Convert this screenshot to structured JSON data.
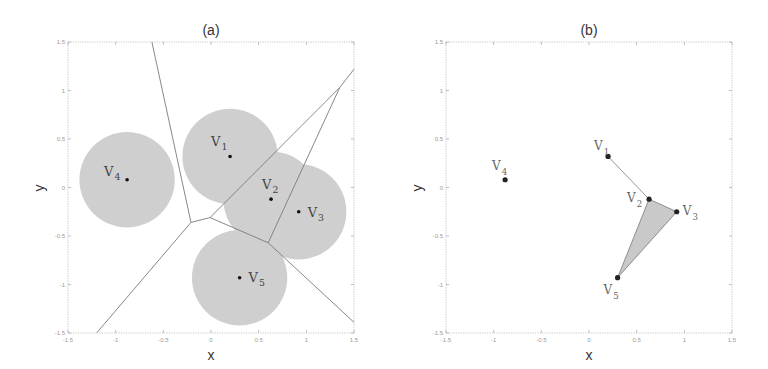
{
  "figure": {
    "panels": [
      {
        "id": "a",
        "title": "(a)",
        "xlabel": "x",
        "ylabel": "y"
      },
      {
        "id": "b",
        "title": "(b)",
        "xlabel": "x",
        "ylabel": "y"
      }
    ],
    "xticks": [
      "-1.5",
      "-1",
      "-0.5",
      "0",
      "0.5",
      "1",
      "1.5"
    ],
    "yticks": [
      "1.5",
      "1",
      "0.5",
      "0",
      "-0.5",
      "-1",
      "-1.5"
    ]
  },
  "chart_data": [
    {
      "type": "scatter",
      "title": "(a)",
      "xlabel": "x",
      "ylabel": "y",
      "xlim": [
        -1.5,
        1.5
      ],
      "ylim": [
        -1.5,
        1.5
      ],
      "grid": false,
      "description": "Nodes with sensing disks (radius ~0.5) and Voronoi partition",
      "disk_radius": 0.5,
      "points": [
        {
          "name": "V1",
          "sub": "1",
          "x": 0.2,
          "y": 0.32
        },
        {
          "name": "V2",
          "sub": "2",
          "x": 0.63,
          "y": -0.12
        },
        {
          "name": "V3",
          "sub": "3",
          "x": 0.92,
          "y": -0.25
        },
        {
          "name": "V4",
          "sub": "4",
          "x": -0.88,
          "y": 0.08
        },
        {
          "name": "V5",
          "sub": "5",
          "x": 0.3,
          "y": -0.93
        }
      ],
      "voronoi_edges": [
        [
          [
            -0.62,
            1.5
          ],
          [
            -0.21,
            -0.36
          ]
        ],
        [
          [
            -0.21,
            -0.36
          ],
          [
            -0.01,
            -0.31
          ]
        ],
        [
          [
            -0.21,
            -0.36
          ],
          [
            -1.2,
            -1.5
          ]
        ],
        [
          [
            -0.01,
            -0.31
          ],
          [
            1.35,
            1.03
          ]
        ],
        [
          [
            -0.01,
            -0.31
          ],
          [
            0.6,
            -0.57
          ]
        ],
        [
          [
            0.6,
            -0.57
          ],
          [
            1.35,
            1.03
          ]
        ],
        [
          [
            0.6,
            -0.57
          ],
          [
            1.5,
            -1.39
          ]
        ],
        [
          [
            1.35,
            1.03
          ],
          [
            1.5,
            1.22
          ]
        ]
      ]
    },
    {
      "type": "scatter",
      "title": "(b)",
      "xlabel": "x",
      "ylabel": "y",
      "xlim": [
        -1.5,
        1.5
      ],
      "ylim": [
        -1.5,
        1.5
      ],
      "grid": false,
      "description": "Connectivity graph: edge V1-V2, shaded triangle V2-V3-V5, isolated V4",
      "points": [
        {
          "name": "V1",
          "sub": "1",
          "x": 0.2,
          "y": 0.32
        },
        {
          "name": "V2",
          "sub": "2",
          "x": 0.63,
          "y": -0.12
        },
        {
          "name": "V3",
          "sub": "3",
          "x": 0.92,
          "y": -0.25
        },
        {
          "name": "V4",
          "sub": "4",
          "x": -0.88,
          "y": 0.08
        },
        {
          "name": "V5",
          "sub": "5",
          "x": 0.3,
          "y": -0.93
        }
      ],
      "edges": [
        [
          "V1",
          "V2"
        ]
      ],
      "triangles": [
        [
          "V2",
          "V3",
          "V5"
        ]
      ]
    }
  ]
}
